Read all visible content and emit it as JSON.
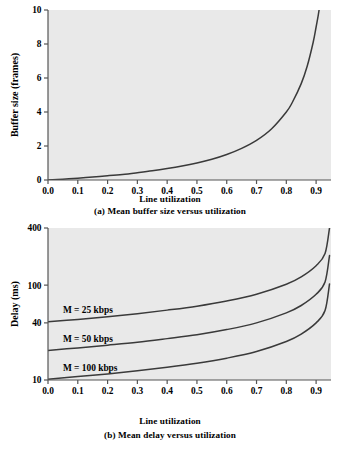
{
  "figure": {
    "background": "#ffffff",
    "plot_background": "#e9e9e9",
    "curve_color": "#3a3a3a",
    "axis_color": "#555555"
  },
  "panel_a": {
    "axis_title_x": "Line utilization",
    "caption": "(a) Mean buffer size versus utilization"
  },
  "panel_b": {
    "axis_title_x": "Line utilization",
    "caption": "(b) Mean delay versus utilization"
  },
  "chart_data": [
    {
      "type": "line",
      "id": "mean-buffer-size",
      "title": "(a) Mean buffer size versus utilization",
      "xlabel": "Line utilization",
      "ylabel": "Buffer size (frames)",
      "xlim": [
        0.0,
        0.95
      ],
      "ylim": [
        0,
        10
      ],
      "yscale": "linear",
      "grid": false,
      "legend": null,
      "xticks": [
        0.0,
        0.1,
        0.2,
        0.3,
        0.4,
        0.5,
        0.6,
        0.7,
        0.8,
        0.9
      ],
      "xticklabels": [
        "0.0",
        "0.1",
        "0.2",
        "0.3",
        "0.4",
        "0.5",
        "0.6",
        "0.7",
        "0.8",
        "0.9"
      ],
      "yticks": [
        0,
        2,
        4,
        6,
        8,
        10
      ],
      "yticklabels": [
        "0",
        "2",
        "4",
        "6",
        "8",
        "10"
      ],
      "series": [
        {
          "name": "mean buffer size",
          "color": "#3a3a3a",
          "x": [
            0.0,
            0.05,
            0.1,
            0.15,
            0.2,
            0.25,
            0.3,
            0.35,
            0.4,
            0.45,
            0.5,
            0.55,
            0.6,
            0.65,
            0.7,
            0.75,
            0.8,
            0.82,
            0.85,
            0.87,
            0.89,
            0.9,
            0.91,
            0.92,
            0.93,
            0.94,
            0.945
          ],
          "values": [
            0.0,
            0.05,
            0.11,
            0.18,
            0.25,
            0.33,
            0.43,
            0.54,
            0.67,
            0.82,
            1.0,
            1.22,
            1.5,
            1.86,
            2.33,
            3.0,
            4.0,
            4.56,
            5.67,
            6.69,
            8.09,
            9.0,
            10.0,
            11.5,
            13.3,
            15.7,
            17.2
          ]
        }
      ]
    },
    {
      "type": "line",
      "id": "mean-delay",
      "title": "(b) Mean delay versus utilization",
      "xlabel": "Line utilization",
      "ylabel": "Delay (ms)",
      "xlim": [
        0.0,
        0.95
      ],
      "ylim": [
        10,
        400
      ],
      "yscale": "log",
      "grid": false,
      "legend_position": "inline-left",
      "xticks": [
        0.0,
        0.1,
        0.2,
        0.3,
        0.4,
        0.5,
        0.6,
        0.7,
        0.8,
        0.9
      ],
      "xticklabels": [
        "0.0",
        "0.1",
        "0.2",
        "0.3",
        "0.4",
        "0.5",
        "0.6",
        "0.7",
        "0.8",
        "0.9"
      ],
      "yticks": [
        10,
        40,
        100,
        400
      ],
      "yticklabels": [
        "10",
        "40",
        "100",
        "400"
      ],
      "annotations": [
        {
          "text": "M = 25 kbps",
          "x": 0.05,
          "y": 55
        },
        {
          "text": "M = 50 kbps",
          "x": 0.05,
          "y": 27
        },
        {
          "text": "M = 100 kbps",
          "x": 0.05,
          "y": 13.5
        }
      ],
      "series": [
        {
          "name": "M = 25 kbps",
          "color": "#3a3a3a",
          "x": [
            0.0,
            0.1,
            0.2,
            0.3,
            0.4,
            0.5,
            0.6,
            0.7,
            0.8,
            0.85,
            0.9,
            0.93,
            0.945
          ],
          "values": [
            41.0,
            43.5,
            46.5,
            50.0,
            54.5,
            60.0,
            68.0,
            80.0,
            102.0,
            122.0,
            160.0,
            215.0,
            400.0
          ]
        },
        {
          "name": "M = 50 kbps",
          "color": "#3a3a3a",
          "x": [
            0.0,
            0.1,
            0.2,
            0.3,
            0.4,
            0.5,
            0.6,
            0.7,
            0.8,
            0.85,
            0.9,
            0.93,
            0.945
          ],
          "values": [
            20.5,
            21.8,
            23.3,
            25.0,
            27.3,
            30.0,
            34.0,
            40.0,
            51.0,
            61.0,
            80.0,
            108.0,
            205.0
          ]
        },
        {
          "name": "M = 100 kbps",
          "color": "#3a3a3a",
          "x": [
            0.0,
            0.1,
            0.2,
            0.3,
            0.4,
            0.5,
            0.6,
            0.7,
            0.8,
            0.85,
            0.9,
            0.93,
            0.945
          ],
          "values": [
            10.2,
            10.9,
            11.6,
            12.5,
            13.6,
            15.0,
            17.0,
            20.0,
            25.5,
            30.5,
            40.0,
            54.0,
            103.0
          ]
        }
      ]
    }
  ]
}
